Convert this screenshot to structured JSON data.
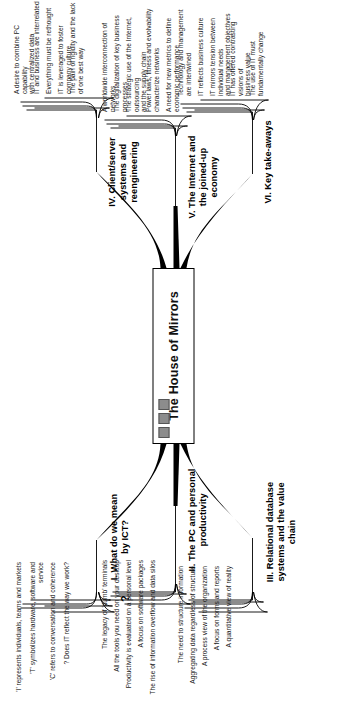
{
  "diagram": {
    "type": "mind-map",
    "orientation": "rotated-90-ccw",
    "center": {
      "label": "The House of Mirrors",
      "chips": [
        "chip-1",
        "chip-2",
        "chip-3"
      ]
    },
    "branches": [
      {
        "id": "branch-i",
        "number": "I.",
        "title": "I. What do we mean\nby ICT?",
        "marker": "?",
        "children": [
          "'I' represents individuals, teams and markets",
          "'T' symbolizes hardware, software and\nservice",
          "'C' refers to conversation and coherence",
          "? Does IT reflect the way we work?"
        ]
      },
      {
        "id": "branch-ii",
        "number": "II.",
        "title": "II. The PC and personal\nproductivity",
        "marker": "",
        "children": [
          "The legacy of 'dumb' terminals",
          "All the tools you need on your desktop",
          "Productivity is evaluated on a personal level",
          "A focus on software packages",
          "The rise of information overflow and data silos"
        ]
      },
      {
        "id": "branch-iii",
        "number": "III.",
        "title": "III. Relational database\nsystems and the value\nchain",
        "marker": "",
        "children": [
          "The need to structure information",
          "Aggregating data regardless of structure",
          "A process view of the organization",
          "A focus on forms and reports",
          "A quantitative view of reality"
        ]
      },
      {
        "id": "branch-iv",
        "number": "IV.",
        "title": "IV. Client/server\nsystems and\nreengineering",
        "marker": "",
        "children": [
          "A desire to combine PC capability\nwith centralized data",
          "IT and business are interrelated",
          "Everything must be rethought",
          "IT is leveraged to foster company culture",
          "The pain of rigidity and the lack\nof one best way"
        ]
      },
      {
        "id": "branch-v",
        "number": "V.",
        "title": "V. The Internet and\nthe joined-up\neconomy",
        "marker": "",
        "children": [
          "A worldwide interconnection of networks",
          "The digitalization of key business processes",
          "The strategic use of the Internet, outsourcing\nand the supply chain",
          "Power laws, fitness and evolvability\ncharacterize networks",
          "A need for new metrics to define\neconomic performance"
        ]
      },
      {
        "id": "branch-vi",
        "number": "VI.",
        "title": "VI. Key take-aways",
        "marker": "",
        "children": [
          "Technology and management are intertwined",
          "IT reflects business culture",
          "IT mirrors tension between individual needs\nand management objectives",
          "IT has offered contrasting visions of\nbusiness value",
          "The use of IT must fundamentally change"
        ]
      }
    ]
  },
  "colors": {
    "ink": "#1a1a1a",
    "line": "#000000",
    "chip": "#8c8c8c",
    "background": "#ffffff"
  }
}
